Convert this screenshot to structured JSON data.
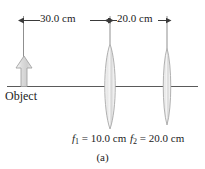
{
  "figure": {
    "caption": "(a)",
    "object_label": "Object",
    "dimensions": [
      {
        "name": "object-to-lens1",
        "label": "30.0 cm",
        "value": 30.0,
        "unit": "cm"
      },
      {
        "name": "lens1-to-lens2",
        "label": "20.0 cm",
        "value": 20.0,
        "unit": "cm"
      }
    ],
    "focal_lengths": [
      {
        "symbol": "f",
        "subscript": "1",
        "equals": "=",
        "label": "10.0 cm",
        "value": 10.0,
        "unit": "cm"
      },
      {
        "symbol": "f",
        "subscript": "2",
        "equals": "=",
        "label": "20.0 cm",
        "value": 20.0,
        "unit": "cm"
      }
    ],
    "elements": {
      "optical_axis": "horizontal-optical-axis",
      "object_arrow": "upward-object-arrow",
      "lens_1": "converging-lens-1",
      "lens_2": "converging-lens-2"
    },
    "colors": {
      "line": "#555555",
      "text": "#1b1b1b",
      "lens_fill_light": "#f7f7f7",
      "lens_fill_mid": "#d8d8d8",
      "lens_stroke": "#9a9a9a",
      "arrow_fill": "#d0d0d0",
      "arrow_stroke": "#9a9a9a",
      "background": "#ffffff"
    }
  }
}
